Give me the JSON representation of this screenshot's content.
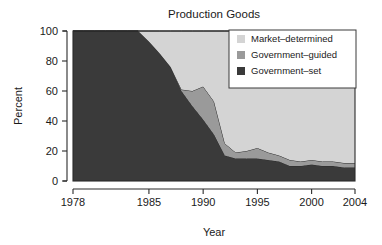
{
  "chart_data": {
    "type": "area",
    "stacked": true,
    "title": "Production Goods",
    "xlabel": "Year",
    "ylabel": "Percent",
    "xlim": [
      1978,
      2004
    ],
    "ylim": [
      0,
      100
    ],
    "grid": false,
    "legend_position": "top-right",
    "xticks": [
      1978,
      1985,
      1990,
      1995,
      2000,
      2004
    ],
    "yticks": [
      0,
      20,
      40,
      60,
      80,
      100
    ],
    "x": [
      1978,
      1979,
      1980,
      1981,
      1982,
      1983,
      1984,
      1985,
      1986,
      1987,
      1988,
      1989,
      1990,
      1991,
      1992,
      1993,
      1994,
      1995,
      1996,
      1997,
      1998,
      1999,
      2000,
      2001,
      2002,
      2003,
      2004
    ],
    "series": [
      {
        "name": "Government-set",
        "color": "#3a3a3a",
        "values": [
          100,
          100,
          100,
          100,
          100,
          100,
          100,
          93,
          85,
          76,
          60,
          50,
          41,
          31,
          17,
          15,
          15,
          15,
          14,
          13,
          10,
          10,
          11,
          10,
          10,
          9,
          9
        ]
      },
      {
        "name": "Government-guided",
        "color": "#9a9a9a",
        "values": [
          0,
          0,
          0,
          0,
          0,
          0,
          0,
          0,
          0,
          0,
          1,
          10,
          22,
          22,
          8,
          4,
          5,
          7,
          5,
          4,
          4,
          3,
          3,
          3,
          3,
          3,
          3
        ]
      },
      {
        "name": "Market-determined",
        "color": "#d4d4d4",
        "values": [
          0,
          0,
          0,
          0,
          0,
          0,
          0,
          7,
          15,
          24,
          39,
          40,
          37,
          47,
          75,
          81,
          80,
          78,
          81,
          83,
          86,
          87,
          86,
          87,
          87,
          88,
          88
        ]
      }
    ],
    "legend_entries": [
      {
        "label": "Market–determined",
        "color": "#d4d4d4"
      },
      {
        "label": "Government–guided",
        "color": "#9a9a9a"
      },
      {
        "label": "Government–set",
        "color": "#3a3a3a"
      }
    ]
  }
}
